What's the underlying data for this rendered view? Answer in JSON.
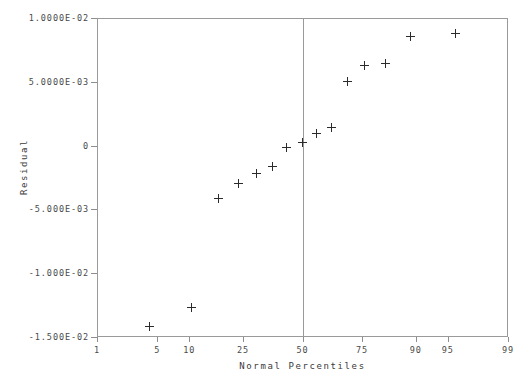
{
  "chart_data": {
    "type": "scatter",
    "title": "",
    "xlabel": "Normal Percentiles",
    "ylabel": "Residual",
    "x_scale": "normal-probability",
    "grid": false,
    "legend": null,
    "xlim": [
      1,
      99
    ],
    "ylim": [
      -0.015,
      0.01
    ],
    "x_ticks": [
      1,
      5,
      10,
      25,
      50,
      75,
      90,
      95,
      99
    ],
    "x_tick_labels": [
      "1",
      "5",
      "10",
      "25",
      "50",
      "75",
      "90",
      "95",
      "99"
    ],
    "y_ticks": [
      0.01,
      0.005,
      0,
      -0.005,
      -0.01,
      -0.015
    ],
    "y_tick_labels": [
      "1.0000E-02",
      "5.0000E-03",
      "0",
      "-5.000E-03",
      "-1.000E-02",
      "-1.500E-02"
    ],
    "annotations": [
      {
        "name": "median-reference-line",
        "kind": "vertical-line",
        "x": 50
      }
    ],
    "marker": "plus",
    "marker_color": "#2b2b2b",
    "points": [
      {
        "x": 4.2,
        "y": -0.01415
      },
      {
        "x": 10.5,
        "y": -0.01265
      },
      {
        "x": 17.0,
        "y": -0.00415
      },
      {
        "x": 23.5,
        "y": -0.003
      },
      {
        "x": 30.0,
        "y": -0.00222
      },
      {
        "x": 36.5,
        "y": -0.0016
      },
      {
        "x": 43.0,
        "y": -0.00015
      },
      {
        "x": 50.0,
        "y": 0.00025
      },
      {
        "x": 56.5,
        "y": 0.00095
      },
      {
        "x": 63.0,
        "y": 0.00145
      },
      {
        "x": 69.5,
        "y": 0.005
      },
      {
        "x": 76.0,
        "y": 0.00625
      },
      {
        "x": 82.5,
        "y": 0.0064
      },
      {
        "x": 89.0,
        "y": 0.00855
      },
      {
        "x": 95.8,
        "y": 0.0088
      }
    ]
  },
  "axes": {
    "x_title": "Normal Percentiles",
    "y_title": "Residual"
  },
  "colors": {
    "frame": "#9a9a9a",
    "marker": "#2b2b2b",
    "text": "#3a3a3a",
    "background": "#ffffff"
  }
}
